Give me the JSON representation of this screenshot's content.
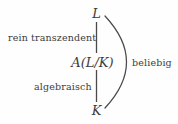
{
  "figure": {
    "kind": "field-extension-tower-diagram",
    "background_color": "#fefefe",
    "ink_color": "#3c3c3c",
    "nodes": [
      {
        "id": "top",
        "text": "L",
        "style": "math-italic"
      },
      {
        "id": "middle",
        "text": "A(L/K)",
        "style": "math-italic"
      },
      {
        "id": "bottom",
        "text": "K",
        "style": "math-italic"
      }
    ],
    "edge_labels": [
      {
        "id": "upper",
        "text": "rein transzendent",
        "side": "left"
      },
      {
        "id": "lower",
        "text": "algebraisch",
        "side": "left"
      }
    ],
    "brace_label": {
      "id": "brace",
      "text": "beliebig",
      "side": "right"
    }
  }
}
